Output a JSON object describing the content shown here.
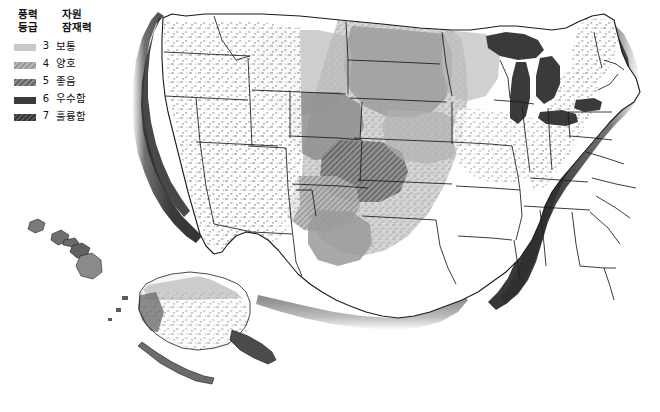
{
  "figure": {
    "type": "thematic-map",
    "background_color": "#ffffff",
    "land_fill": "#ffffff",
    "boundary_color": "#1a1a1a"
  },
  "legend": {
    "header": {
      "class_label": "풍력\n등급",
      "potential_label": "자원\n잠재력"
    },
    "items": [
      {
        "level": "3",
        "label": "보통",
        "fill": "#c9c9c9",
        "pattern": "solid",
        "swatch_name": "legend-swatch-class-3"
      },
      {
        "level": "4",
        "label": "양호",
        "fill": "#a8a8a8",
        "pattern": "hatched",
        "swatch_name": "legend-swatch-class-4"
      },
      {
        "level": "5",
        "label": "좋음",
        "fill": "#6f6f6f",
        "pattern": "hatched",
        "swatch_name": "legend-swatch-class-5"
      },
      {
        "level": "6",
        "label": "우수함",
        "fill": "#3b3b3b",
        "pattern": "solid",
        "swatch_name": "legend-swatch-class-6"
      },
      {
        "level": "7",
        "label": "훌륭함",
        "fill": "#4a4a4a",
        "pattern": "hatched",
        "swatch_name": "legend-swatch-class-7"
      }
    ]
  },
  "map_regions": {
    "conus": "Contiguous United States",
    "alaska": "Alaska inset",
    "hawaii": "Hawaii inset",
    "great_lakes": "Great Lakes",
    "offshore_atlantic": "Atlantic offshore band",
    "offshore_pacific": "Pacific offshore band",
    "offshore_gulf": "Gulf of Mexico offshore band"
  }
}
